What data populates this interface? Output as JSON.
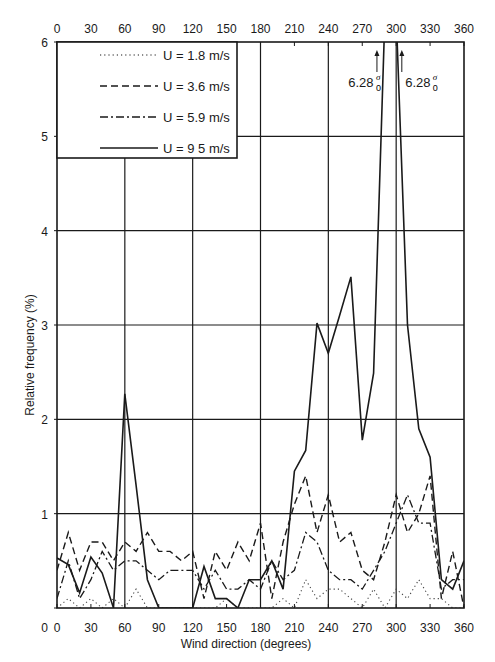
{
  "chart_data": {
    "type": "line",
    "title": "",
    "xlabel": "Wind direction (degrees)",
    "ylabel": "Relative frequency (%)",
    "xlim": [
      0,
      360
    ],
    "ylim": [
      0,
      6
    ],
    "grid": true,
    "x_ticks": [
      0,
      30,
      60,
      90,
      120,
      150,
      180,
      210,
      240,
      270,
      300,
      330,
      360
    ],
    "x_ticks_top": [
      0,
      30,
      60,
      90,
      120,
      150,
      180,
      210,
      240,
      270,
      300,
      330,
      360
    ],
    "y_ticks": [
      0,
      1,
      2,
      3,
      4,
      5,
      6
    ],
    "legend_position": "upper-left",
    "x": [
      0,
      10,
      20,
      30,
      40,
      50,
      60,
      70,
      80,
      90,
      100,
      110,
      120,
      130,
      140,
      150,
      160,
      170,
      180,
      190,
      200,
      210,
      220,
      230,
      240,
      250,
      260,
      270,
      280,
      290,
      300,
      310,
      320,
      330,
      340,
      350,
      360
    ],
    "series": [
      {
        "name": "U = 1.8 m/s",
        "style": "dotted",
        "values": [
          0.0,
          0.1,
          0.0,
          0.1,
          0.0,
          0.1,
          0.0,
          0.2,
          0.0,
          0.0,
          0.0,
          0.0,
          0.0,
          0.0,
          0.0,
          0.1,
          0.0,
          0.0,
          0.0,
          0.0,
          0.1,
          0.0,
          0.3,
          0.1,
          0.2,
          0.2,
          0.1,
          0.0,
          0.2,
          0.0,
          0.2,
          0.1,
          0.3,
          0.1,
          0.1,
          0.0,
          0.0
        ]
      },
      {
        "name": "U = 3.6 m/s",
        "style": "dashed",
        "values": [
          0.4,
          0.8,
          0.4,
          0.7,
          0.7,
          0.5,
          0.7,
          0.6,
          0.8,
          0.6,
          0.6,
          0.5,
          0.6,
          0.1,
          0.6,
          0.4,
          0.7,
          0.5,
          0.9,
          0.1,
          0.7,
          1.1,
          1.4,
          0.8,
          1.2,
          0.7,
          0.8,
          0.4,
          0.3,
          0.7,
          1.2,
          0.8,
          1.0,
          1.4,
          0.1,
          0.6,
          0.0
        ]
      },
      {
        "name": "U = 5.9 m/s",
        "style": "dashdot",
        "values": [
          0.1,
          0.5,
          0.1,
          0.3,
          0.6,
          0.4,
          0.5,
          0.5,
          0.4,
          0.3,
          0.4,
          0.4,
          0.4,
          0.2,
          0.4,
          0.2,
          0.2,
          0.3,
          0.2,
          0.5,
          0.3,
          0.4,
          0.8,
          0.7,
          0.4,
          0.3,
          0.3,
          0.2,
          0.4,
          0.6,
          0.9,
          1.2,
          0.9,
          0.9,
          0.2,
          0.3,
          0.3
        ]
      },
      {
        "name": "U = 9.5 m/s",
        "style": "solid",
        "values": [
          0.53,
          0.46,
          0.16,
          0.54,
          0.37,
          0.0,
          2.27,
          1.3,
          0.3,
          0.0,
          0.0,
          0.0,
          0.0,
          0.44,
          0.1,
          0.1,
          0.0,
          0.3,
          0.3,
          0.5,
          0.2,
          1.45,
          1.67,
          3.02,
          2.7,
          3.1,
          3.51,
          1.78,
          2.49,
          6.28,
          6.28,
          3.0,
          1.9,
          1.6,
          0.3,
          0.2,
          0.5
        ],
        "clipped_points": [
          {
            "x": 290,
            "value": 6.28
          },
          {
            "x": 300,
            "value": 6.28
          }
        ]
      }
    ],
    "annotations": [
      {
        "text": "6.28",
        "subscript": "0",
        "superscript": "σ",
        "x": 283,
        "arrow": "up"
      },
      {
        "text": "6.28",
        "subscript": "0",
        "superscript": "σ",
        "x": 305,
        "arrow": "up"
      }
    ]
  },
  "legend": {
    "items": [
      {
        "label": "U = 1.8 m/s",
        "style": "dotted"
      },
      {
        "label": "U = 3.6 m/s",
        "style": "dashed"
      },
      {
        "label": "U = 5.9 m/s",
        "style": "dashdot"
      },
      {
        "label": "U = 9 5 m/s",
        "style": "solid"
      }
    ]
  },
  "axes": {
    "xlabel": "Wind direction (degrees)",
    "ylabel": "Relative frequency (%)"
  },
  "annotation_labels": {
    "left": "6.28",
    "right": "6.28",
    "sup": "σ",
    "sub": "0"
  },
  "colors": {
    "line": "#1a1a1a",
    "grid": "#1a1a1a",
    "background": "#ffffff"
  }
}
